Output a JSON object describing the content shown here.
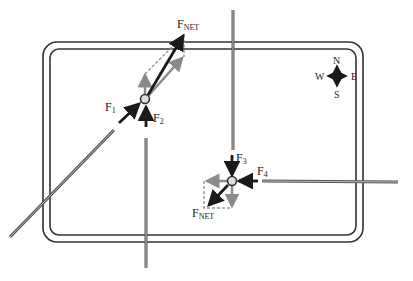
{
  "diagram": {
    "type": "force-vector-intersection",
    "colors": {
      "primary_arrow": "#1a1a1a",
      "component_arrow": "#8a8a8a",
      "road_line": "#555555",
      "border": "#333333",
      "background": "#ffffff"
    },
    "compass": {
      "north": "N",
      "south": "S",
      "east": "E",
      "west": "W"
    },
    "car1": {
      "forces": {
        "f1": {
          "label": "F",
          "sub": "1"
        },
        "f2": {
          "label": "F",
          "sub": "2"
        },
        "fnet": {
          "label": "F",
          "sub": "NET"
        }
      }
    },
    "car2": {
      "forces": {
        "f3": {
          "label": "F",
          "sub": "3"
        },
        "f4": {
          "label": "F",
          "sub": "4"
        },
        "fnet": {
          "label": "F",
          "sub": "NET"
        }
      }
    }
  }
}
